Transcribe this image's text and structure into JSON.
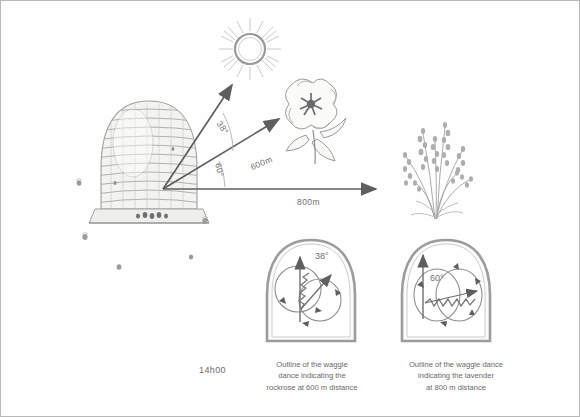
{
  "figure": {
    "time_label": "14h00",
    "ink_color": "#8a8a8a",
    "text_color": "#6a6a6a",
    "border_color": "#b8b8b8",
    "background": "#fefefe"
  },
  "objects": {
    "sun": "sun",
    "hive": "beehive-skep",
    "flower": "rockrose-flower",
    "plant": "lavender-plant"
  },
  "vectors": [
    {
      "id": "sun-vector",
      "label": "",
      "angle_label": "38°",
      "target": "sun"
    },
    {
      "id": "rockrose-vector",
      "label": "600m",
      "angle_label": "60°",
      "target": "rockrose"
    },
    {
      "id": "lavender-vector",
      "label": "800m",
      "angle_label": "",
      "target": "lavender"
    }
  ],
  "angles": {
    "sun_to_rockrose": "38°",
    "rockrose_to_lavender": "60°"
  },
  "distances": {
    "rockrose": "600m",
    "lavender": "800m"
  },
  "dances": [
    {
      "id": "dance-rockrose",
      "angle": "38°",
      "caption": "Outline of the waggle dance indicating the rockrose at 600 m distance",
      "caption_lines": [
        "Outline of the waggle",
        "dance indicating the",
        "rockrose at 600 m distance"
      ]
    },
    {
      "id": "dance-lavender",
      "angle": "60°",
      "caption": "Outline of the waggle dance indicating the lavender at 800 m distance",
      "caption_lines": [
        "Outline of the waggle dance",
        "indicating the lavender",
        "at 800 m distance"
      ]
    }
  ]
}
